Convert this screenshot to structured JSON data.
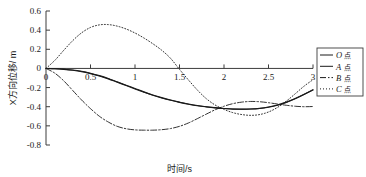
{
  "chart_data": {
    "type": "line",
    "title": "",
    "xlabel": "时间/s",
    "ylabel": "X方向位移/ m",
    "xlim": [
      0,
      3
    ],
    "ylim": [
      -0.8,
      0.6
    ],
    "xticks": [
      "0",
      "0.5",
      "1",
      "1.5",
      "2",
      "2.5",
      "3"
    ],
    "xtick_values": [
      0,
      0.5,
      1,
      1.5,
      2,
      2.5,
      3
    ],
    "yticks": [
      "0.6",
      "0.4",
      "0.2",
      "0",
      "-0.2",
      "-0.4",
      "-0.6",
      "-0.8"
    ],
    "ytick_values": [
      0.6,
      0.4,
      0.2,
      0,
      -0.2,
      -0.4,
      -0.6,
      -0.8
    ],
    "grid": false,
    "legend_position": "right-outside",
    "x": [
      0,
      0.1,
      0.2,
      0.3,
      0.4,
      0.5,
      0.6,
      0.7,
      0.8,
      0.9,
      1.0,
      1.1,
      1.2,
      1.3,
      1.4,
      1.5,
      1.6,
      1.7,
      1.8,
      1.9,
      2.0,
      2.1,
      2.2,
      2.3,
      2.4,
      2.5,
      2.6,
      2.7,
      2.8,
      2.9,
      3.0
    ],
    "series": [
      {
        "name": "O点",
        "label_latin": "O",
        "label_cjk": "点",
        "style": "solid",
        "color": "#1a1a1a",
        "values": [
          0.0,
          -0.003,
          -0.008,
          -0.016,
          -0.03,
          -0.05,
          -0.075,
          -0.105,
          -0.14,
          -0.175,
          -0.21,
          -0.245,
          -0.277,
          -0.305,
          -0.33,
          -0.352,
          -0.372,
          -0.388,
          -0.4,
          -0.41,
          -0.418,
          -0.424,
          -0.425,
          -0.424,
          -0.418,
          -0.405,
          -0.385,
          -0.355,
          -0.318,
          -0.272,
          -0.225
        ]
      },
      {
        "name": "A点",
        "label_latin": "A",
        "label_cjk": "点",
        "style": "solid",
        "color": "#1a1a1a",
        "values": [
          0.0,
          -0.004,
          -0.01,
          -0.019,
          -0.033,
          -0.054,
          -0.079,
          -0.109,
          -0.144,
          -0.179,
          -0.214,
          -0.248,
          -0.28,
          -0.308,
          -0.333,
          -0.355,
          -0.374,
          -0.39,
          -0.402,
          -0.412,
          -0.419,
          -0.425,
          -0.426,
          -0.424,
          -0.417,
          -0.403,
          -0.382,
          -0.352,
          -0.314,
          -0.27,
          -0.222
        ]
      },
      {
        "name": "B点",
        "label_latin": "B",
        "label_cjk": "点",
        "style": "dashdot",
        "color": "#1a1a1a",
        "values": [
          0.0,
          -0.05,
          -0.13,
          -0.23,
          -0.33,
          -0.42,
          -0.5,
          -0.56,
          -0.605,
          -0.63,
          -0.642,
          -0.645,
          -0.645,
          -0.64,
          -0.628,
          -0.605,
          -0.57,
          -0.525,
          -0.478,
          -0.432,
          -0.395,
          -0.368,
          -0.352,
          -0.345,
          -0.348,
          -0.358,
          -0.372,
          -0.385,
          -0.395,
          -0.4,
          -0.398
        ]
      },
      {
        "name": "C点",
        "label_latin": "C",
        "label_cjk": "点",
        "style": "dotted",
        "color": "#1a1a1a",
        "values": [
          0.0,
          0.085,
          0.19,
          0.29,
          0.372,
          0.428,
          0.455,
          0.458,
          0.442,
          0.412,
          0.37,
          0.318,
          0.258,
          0.19,
          0.105,
          -0.01,
          -0.12,
          -0.225,
          -0.315,
          -0.382,
          -0.428,
          -0.462,
          -0.482,
          -0.49,
          -0.482,
          -0.455,
          -0.408,
          -0.342,
          -0.265,
          -0.185,
          -0.118
        ]
      }
    ]
  },
  "legend": {
    "entries": [
      {
        "latin": "O",
        "cjk": "点",
        "style": "solid"
      },
      {
        "latin": "A",
        "cjk": "点",
        "style": "solid"
      },
      {
        "latin": "B",
        "cjk": "点",
        "style": "dashdot"
      },
      {
        "latin": "C",
        "cjk": "点",
        "style": "dotted"
      }
    ]
  },
  "axes": {
    "x_label": "时间/s",
    "y_label": "X方向位移/ m"
  }
}
